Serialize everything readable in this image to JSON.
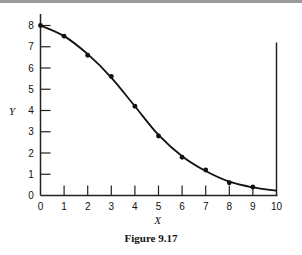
{
  "chart_data": {
    "type": "line",
    "title": "",
    "caption": "Figure 9.17",
    "xlabel": "X",
    "ylabel": "Y",
    "xlim": [
      0,
      10
    ],
    "ylim": [
      0,
      8
    ],
    "xticks": [
      0,
      1,
      2,
      3,
      4,
      5,
      6,
      7,
      8,
      9,
      10
    ],
    "yticks": [
      0,
      1,
      2,
      3,
      4,
      5,
      6,
      7,
      8
    ],
    "grid": false,
    "legend": null,
    "series": [
      {
        "name": "data points",
        "style": "markers",
        "x": [
          0,
          1,
          2,
          3,
          4,
          5,
          6,
          7,
          8,
          9
        ],
        "y": [
          8.0,
          7.5,
          6.6,
          5.6,
          4.2,
          2.8,
          1.8,
          1.2,
          0.6,
          0.4
        ]
      },
      {
        "name": "fitted curve",
        "style": "smooth-line",
        "x": [
          0,
          1,
          2,
          3,
          4,
          5,
          6,
          7,
          8,
          9,
          10
        ],
        "y": [
          8.0,
          7.5,
          6.65,
          5.55,
          4.2,
          2.85,
          1.85,
          1.15,
          0.65,
          0.38,
          0.22
        ]
      }
    ],
    "annotations": [
      "vertical line at X = 10 extending to Y ≈ 7.2"
    ]
  },
  "labels": {
    "x_axis": "X",
    "y_axis": "Y",
    "caption": "Figure 9.17"
  }
}
